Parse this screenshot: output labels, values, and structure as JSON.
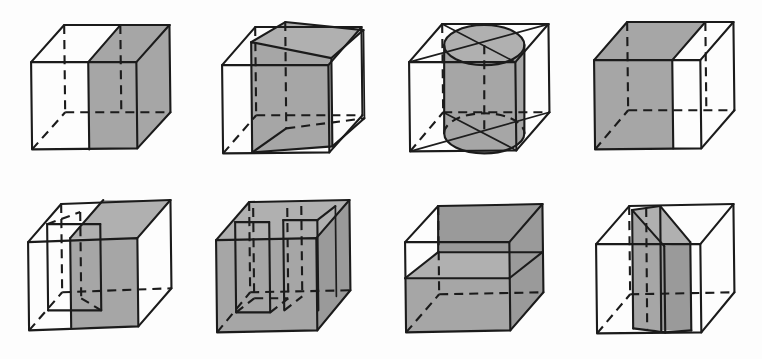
{
  "page": {
    "width": 762,
    "height": 359,
    "background_color": "#fdfdfd",
    "ink_color": "#1b1b1b",
    "shade_color": "#a6a6a6",
    "rows": 2,
    "columns": 4,
    "total_figures": 8
  },
  "figures": [
    {
      "index": 1,
      "row": 1,
      "column": 1,
      "name": "cube-vertical-slab-right",
      "caption": "",
      "solid": "cube",
      "section": "vertical planar slab occupying the right half of the cube",
      "shaded": true,
      "hidden_edges": "dashed",
      "inscribed_solid": "none"
    },
    {
      "index": 2,
      "row": 1,
      "column": 2,
      "name": "cube-inscribed-box",
      "caption": "",
      "solid": "cube",
      "section": "smaller rectangular box inscribed inside the cube, rotated about the vertical axis",
      "shaded": true,
      "hidden_edges": "dashed",
      "inscribed_solid": "rectangular prism"
    },
    {
      "index": 3,
      "row": 1,
      "column": 3,
      "name": "cube-inscribed-cylinder",
      "caption": "",
      "solid": "cube",
      "section": "cylinder inscribed in the cube with elliptical top and bottom faces",
      "shaded": true,
      "hidden_edges": "dashed",
      "inscribed_solid": "cylinder"
    },
    {
      "index": 4,
      "row": 1,
      "column": 4,
      "name": "cube-vertical-slab-left",
      "caption": "",
      "solid": "cube",
      "section": "vertical planar slab occupying the left half of the cube",
      "shaded": true,
      "hidden_edges": "dashed",
      "inscribed_solid": "none"
    },
    {
      "index": 5,
      "row": 2,
      "column": 1,
      "name": "cube-slab-with-notch",
      "caption": "",
      "solid": "cube",
      "section": "vertical slab with a rectangular notch cut into its front upper region",
      "shaded": true,
      "hidden_edges": "dashed",
      "inscribed_solid": "none"
    },
    {
      "index": 6,
      "row": 2,
      "column": 2,
      "name": "cube-multiple-slabs",
      "caption": "",
      "solid": "cube",
      "section": "several parallel vertical slabs filling the cube with gaps between them",
      "shaded": true,
      "hidden_edges": "dashed",
      "inscribed_solid": "none"
    },
    {
      "index": 7,
      "row": 2,
      "column": 3,
      "name": "cube-horizontal-shelf",
      "caption": "",
      "solid": "cube",
      "section": "horizontal shelf plate plus rear and side walls forming a tray",
      "shaded": true,
      "hidden_edges": "dashed",
      "inscribed_solid": "none"
    },
    {
      "index": 8,
      "row": 2,
      "column": 4,
      "name": "cube-central-wedge",
      "caption": "",
      "solid": "cube",
      "section": "folded central vertical wedge / bent plate through the middle of the cube",
      "shaded": true,
      "hidden_edges": "dashed",
      "inscribed_solid": "none"
    }
  ]
}
